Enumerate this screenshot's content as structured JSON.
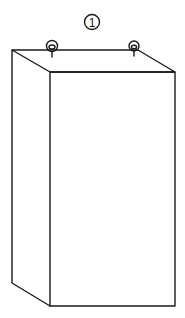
{
  "figure": {
    "label": "1",
    "colors": {
      "line": "#1a1a1a",
      "background": "#ffffff"
    }
  }
}
